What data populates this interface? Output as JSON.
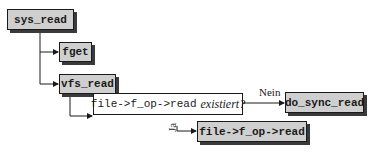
{
  "diagram": {
    "nodes": {
      "sys_read": {
        "label": "sys_read"
      },
      "fget": {
        "label": "fget"
      },
      "vfs_read": {
        "label": "vfs_read"
      },
      "decision": {
        "code": "file->f_op->read",
        "question": "existiert?"
      },
      "do_sync_read": {
        "label": "do_sync_read"
      },
      "f_op_read": {
        "label": "file->f_op->read"
      }
    },
    "edges": {
      "no_label": "Nein",
      "yes_label": "Ja"
    },
    "colors": {
      "node_fill": "#cfcfcf",
      "decision_fill": "#ffffff",
      "stroke": "#1a1a1a",
      "shadow": "#3a3a3a"
    }
  }
}
